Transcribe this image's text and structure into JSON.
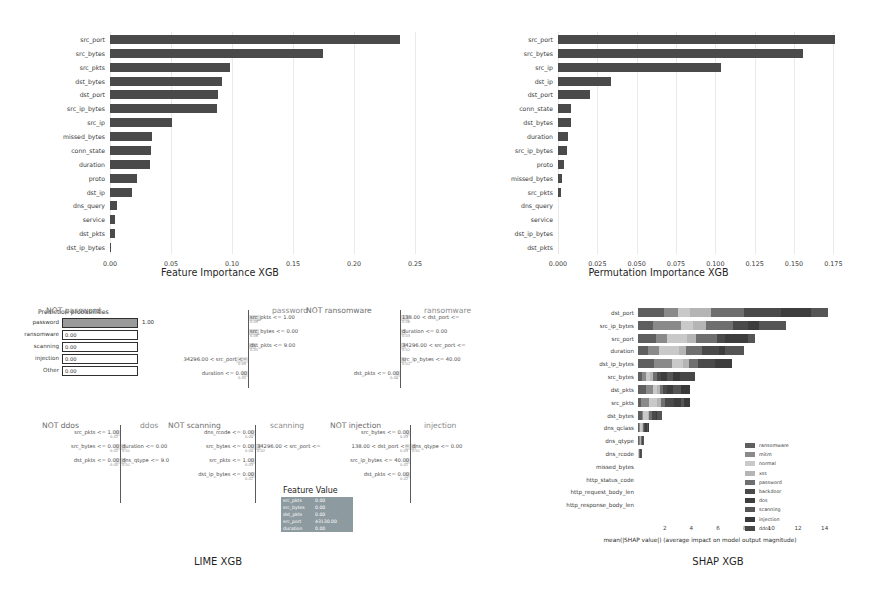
{
  "figure": {
    "captions": {
      "lime": "LIME XGB",
      "shap": "SHAP XGB"
    }
  },
  "chart_data": [
    {
      "id": "feature_importance_xgb",
      "type": "bar",
      "orientation": "horizontal",
      "title": "Feature Importance XGB",
      "xlabel": "Feature Importance XGB",
      "ylabel": "",
      "xlim": [
        0,
        0.25
      ],
      "xticks": [
        "0.00",
        "0.05",
        "0.10",
        "0.15",
        "0.20",
        "0.25"
      ],
      "grid": true,
      "categories": [
        "src_port",
        "src_bytes",
        "src_pkts",
        "dst_bytes",
        "dst_port",
        "src_ip_bytes",
        "src_ip",
        "missed_bytes",
        "conn_state",
        "duration",
        "proto",
        "dst_ip",
        "dns_query",
        "service",
        "dst_pkts",
        "dst_ip_bytes"
      ],
      "values": [
        0.2375,
        0.1745,
        0.0985,
        0.0915,
        0.0885,
        0.088,
        0.051,
        0.0345,
        0.0335,
        0.0325,
        0.0225,
        0.018,
        0.0055,
        0.0045,
        0.004,
        0.0002
      ]
    },
    {
      "id": "permutation_importance_xgb",
      "type": "bar",
      "orientation": "horizontal",
      "title": "Permutation Importance XGB",
      "xlabel": "Permutation Importance XGB",
      "ylabel": "",
      "xlim": [
        0,
        0.1875
      ],
      "xticks": [
        "0.000",
        "0.025",
        "0.050",
        "0.075",
        "0.100",
        "0.125",
        "0.150",
        "0.175"
      ],
      "grid": true,
      "categories": [
        "src_port",
        "src_bytes",
        "src_ip",
        "dst_ip",
        "dst_port",
        "conn_state",
        "dst_bytes",
        "duration",
        "src_ip_bytes",
        "proto",
        "missed_bytes",
        "src_pkts",
        "dns_query",
        "service",
        "dst_ip_bytes",
        "dst_pkts"
      ],
      "values": [
        0.176,
        0.156,
        0.1035,
        0.0335,
        0.0205,
        0.0085,
        0.008,
        0.0062,
        0.0058,
        0.004,
        0.0025,
        0.0018,
        0.0,
        0.0,
        0.0,
        0.0
      ]
    },
    {
      "id": "shap_xgb",
      "type": "bar",
      "orientation": "horizontal",
      "stacked": true,
      "title": "SHAP XGB",
      "xlabel": "mean(|SHAP value|) (average impact on model output magnitude)",
      "xlim": [
        0,
        15
      ],
      "xticks": [
        "2",
        "4",
        "6",
        "8",
        "10",
        "12",
        "14"
      ],
      "grid": false,
      "legend_position": "center-right",
      "legend": [
        "ransomware",
        "mitm",
        "normal",
        "xss",
        "password",
        "backdoor",
        "dos",
        "scanning",
        "injection",
        "ddos"
      ],
      "legend_colors": [
        "#5f5f5f",
        "#8a8a8a",
        "#c9c9c9",
        "#b5b5b5",
        "#6f6f6f",
        "#4a4a4a",
        "#3d3d3d",
        "#555555",
        "#3a3a3a",
        "#474747"
      ],
      "categories": [
        "dst_port",
        "src_ip_bytes",
        "src_port",
        "duration",
        "dst_ip_bytes",
        "src_bytes",
        "dst_pkts",
        "src_pkts",
        "dst_bytes",
        "dns_qclass",
        "dns_qtype",
        "dns_rcode",
        "missed_bytes",
        "http_status_code",
        "http_request_body_len",
        "http_response_body_len"
      ],
      "values": [
        14.0,
        10.3,
        8.6,
        7.8,
        6.9,
        4.3,
        3.3,
        3.5,
        1.6,
        0.75,
        0.45,
        0.25,
        0.03,
        0.0,
        0.0,
        0.0
      ]
    }
  ],
  "lime": {
    "probabilities": {
      "title": "Prediction probabilities",
      "rows": [
        {
          "label": "password",
          "value": "1.00",
          "p": 1.0
        },
        {
          "label": "ransomware",
          "value": "0.00",
          "p": 0.0
        },
        {
          "label": "scanning",
          "value": "0.00",
          "p": 0.0
        },
        {
          "label": "injection",
          "value": "0.00",
          "p": 0.0
        },
        {
          "label": "Other",
          "value": "0.00",
          "p": 0.0
        }
      ]
    },
    "feature_value": {
      "title": "Feature Value",
      "rows": [
        {
          "feature": "src_pkts",
          "value": "0.00"
        },
        {
          "feature": "src_bytes",
          "value": "0.00"
        },
        {
          "feature": "dst_pkts",
          "value": "0.00"
        },
        {
          "feature": "src_port",
          "value": "43130.00"
        },
        {
          "feature": "duration",
          "value": "0.00"
        }
      ]
    },
    "panels": [
      {
        "id": "password",
        "neg_label": "NOT password",
        "pos_label": "password",
        "pos": [
          {
            "text": "src_pkts <= 1.00",
            "weight": "0.09"
          },
          {
            "text": "src_bytes <= 0.00",
            "weight": "0.08"
          },
          {
            "text": "dst_pkts <= 9.00",
            "weight": "0.05"
          }
        ],
        "neg": [
          {
            "text": "34296.00 < src_port <=",
            "weight": "0.09"
          },
          {
            "text": "duration <= 0.00",
            "weight": "0.05"
          }
        ]
      },
      {
        "id": "ransomware",
        "neg_label": "NOT ransomware",
        "pos_label": "ransomware",
        "pos": [
          {
            "text": "138.00 < dst_port <=",
            "weight": "0.06"
          },
          {
            "text": "duration <= 0.00",
            "weight": "0.03"
          },
          {
            "text": "34296.00 < src_port <=",
            "weight": "0.02"
          },
          {
            "text": "src_ip_bytes <= 40.00",
            "weight": "0.02"
          }
        ],
        "neg": [
          {
            "text": "dst_pkts <= 0.00",
            "weight": "0.04"
          }
        ]
      },
      {
        "id": "ddos",
        "neg_label": "NOT ddos",
        "pos_label": "ddos",
        "pos": [
          {
            "text": "duration <= 0.00",
            "weight": "0.01"
          },
          {
            "text": "dns_qtype <= 9.0",
            "weight": "0.01"
          }
        ],
        "neg": [
          {
            "text": "src_pkts <= 1.00",
            "weight": "0.02"
          },
          {
            "text": "src_bytes <= 0.00",
            "weight": "0.02"
          },
          {
            "text": "dst_pkts <= 0.00",
            "weight": "0.00"
          }
        ]
      },
      {
        "id": "scanning",
        "neg_label": "NOT scanning",
        "pos_label": "scanning",
        "pos": [
          {
            "text": "34296.00 < src_port <=",
            "weight": "0.02"
          }
        ],
        "neg": [
          {
            "text": "dns_rcode <= 0.00",
            "weight": "0.04"
          },
          {
            "text": "src_bytes <= 0.00",
            "weight": "0.04"
          },
          {
            "text": "src_pkts <= 1.00",
            "weight": "0.03"
          },
          {
            "text": "dst_ip_bytes <= 0.00",
            "weight": "0.02"
          }
        ]
      },
      {
        "id": "injection",
        "neg_label": "NOT injection",
        "pos_label": "injection",
        "pos": [
          {
            "text": "dns_qtype <= 0.00",
            "weight": "0.01"
          }
        ],
        "neg": [
          {
            "text": "src_bytes <= 0.00",
            "weight": "0.03"
          },
          {
            "text": "138.00 < dst_port <=",
            "weight": "0.03"
          },
          {
            "text": "src_ip_bytes <= 40.00",
            "weight": "0.02"
          },
          {
            "text": "dst_pkts <= 0.00",
            "weight": "0.02"
          }
        ]
      }
    ]
  }
}
